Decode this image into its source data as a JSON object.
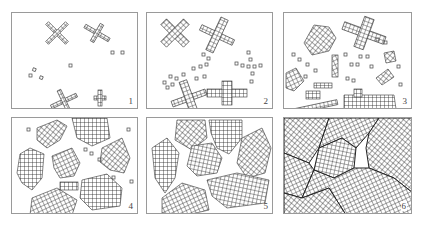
{
  "figure": {
    "panels": [
      {
        "id": 1,
        "label": "1",
        "stage": "nuclei and small crystallites"
      },
      {
        "id": 2,
        "label": "2",
        "stage": "crystallites growing, more nuclei"
      },
      {
        "id": 3,
        "label": "3",
        "stage": "growing crystals, many nuclei"
      },
      {
        "id": 4,
        "label": "4",
        "stage": "large irregular crystals"
      },
      {
        "id": 5,
        "label": "5",
        "stage": "crystals nearly impinging"
      },
      {
        "id": 6,
        "label": "6",
        "stage": "fully grain-filled polycrystal with grain boundaries"
      }
    ]
  },
  "colors": {
    "line": "#333333",
    "border": "#9a9a9a",
    "background": "#ffffff"
  }
}
